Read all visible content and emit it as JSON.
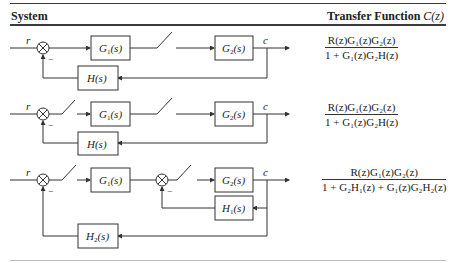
{
  "table": {
    "headers": {
      "system": "System",
      "transfer_function_prefix": "Transfer Function ",
      "transfer_function_symbol": "C(z)"
    },
    "rows": [
      {
        "system": {
          "input": "r",
          "output": "c",
          "minus_sign": "−",
          "blocks": {
            "g1": "G",
            "g1_sub": "1",
            "g2": "G",
            "g2_sub": "2",
            "h": "H"
          },
          "samplers": [
            "after G1(s)"
          ]
        },
        "transfer_function": {
          "numerator": "R(z)G₁(z)G₂(z)",
          "denominator": "1 + G₁(z)G₂H(z)"
        }
      },
      {
        "system": {
          "input": "r",
          "output": "c",
          "minus_sign": "−",
          "blocks": {
            "g1": "G",
            "g1_sub": "1",
            "g2": "G",
            "g2_sub": "2",
            "h": "H"
          },
          "samplers": [
            "after summing junction",
            "after G1(s)"
          ]
        },
        "transfer_function": {
          "numerator": "R(z)G₁(z)G₂(z)",
          "denominator": "1 + G₁(z)G₂H(z)"
        }
      },
      {
        "system": {
          "input": "r",
          "output": "c",
          "minus_sign": "−",
          "blocks": {
            "g1": "G",
            "g1_sub": "1",
            "g2": "G",
            "g2_sub": "2",
            "h1": "H",
            "h1_sub": "1",
            "h2": "H",
            "h2_sub": "2"
          },
          "samplers": [
            "after outer summing junction",
            "after inner summing junction"
          ]
        },
        "transfer_function": {
          "numerator": "R(z)G₁(z)G₂(z)",
          "denominator": "1 + G₂H₁(z) + G₁(z)G₂H₂(z)"
        }
      }
    ]
  },
  "block_suffix": "(s)"
}
